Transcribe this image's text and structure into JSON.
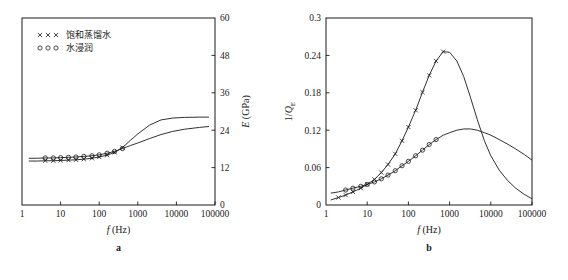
{
  "figure": {
    "panels": [
      "a",
      "b"
    ],
    "legend": {
      "entries": [
        {
          "marker": "cross-marker",
          "symbol": "× × ×",
          "label": "饱和蒸馏水"
        },
        {
          "marker": "circle-marker",
          "symbol": "○ ○ ○",
          "label": "水浸润"
        }
      ]
    }
  },
  "chart_data": [
    {
      "type": "line",
      "panel_label": "a",
      "title": "",
      "xlabel": "f (Hz)",
      "ylabel": "E (GPa)",
      "xscale": "log",
      "xlim": [
        1,
        100000
      ],
      "ylim": [
        0,
        60
      ],
      "xticks": [
        1,
        10,
        100,
        1000,
        10000,
        100000
      ],
      "xtick_labels": [
        "1",
        "10",
        "100",
        "1000",
        "10000",
        "100000"
      ],
      "yticks": [
        0,
        12,
        24,
        36,
        48,
        60
      ],
      "ytick_labels": [
        "0",
        "12",
        "24",
        "36",
        "48",
        "60"
      ],
      "yaxis_position": "right",
      "grid": false,
      "legend_position": "upper-left",
      "series": [
        {
          "name": "饱和蒸馏水",
          "marker": "cross-marker",
          "x": [
            1.5,
            2.5,
            4,
            6.5,
            10,
            16,
            25,
            40,
            65,
            100,
            160,
            250,
            400,
            650,
            1000,
            2000,
            4000,
            8000,
            16000,
            40000,
            70000
          ],
          "y": [
            14.1,
            14.1,
            14.2,
            14.2,
            14.3,
            14.4,
            14.5,
            14.7,
            15.0,
            15.4,
            16.0,
            16.9,
            18.4,
            20.8,
            22.8,
            25.6,
            27.3,
            27.9,
            28.1,
            28.2,
            28.2
          ],
          "marker_x": [
            4,
            6.5,
            10,
            16,
            25,
            40,
            65,
            100,
            160,
            250,
            400
          ],
          "marker_y": [
            14.2,
            14.2,
            14.3,
            14.4,
            14.5,
            14.7,
            15.0,
            15.4,
            16.0,
            16.9,
            18.4
          ]
        },
        {
          "name": "水浸润",
          "marker": "circle-marker",
          "x": [
            1.5,
            2.5,
            4,
            6.5,
            10,
            16,
            25,
            40,
            65,
            100,
            160,
            250,
            400,
            650,
            1000,
            2000,
            4000,
            8000,
            16000,
            40000,
            70000
          ],
          "y": [
            15.0,
            15.0,
            15.1,
            15.1,
            15.2,
            15.3,
            15.4,
            15.6,
            15.8,
            16.1,
            16.6,
            17.2,
            18.1,
            19.1,
            19.9,
            21.3,
            22.6,
            23.6,
            24.3,
            24.9,
            25.2
          ],
          "marker_x": [
            4,
            6.5,
            10,
            16,
            25,
            40,
            65,
            100,
            160,
            250,
            400
          ],
          "marker_y": [
            15.1,
            15.1,
            15.2,
            15.3,
            15.4,
            15.6,
            15.8,
            16.1,
            16.6,
            17.2,
            18.1
          ]
        }
      ]
    },
    {
      "type": "line",
      "panel_label": "b",
      "title": "",
      "xlabel": "f (Hz)",
      "ylabel": "1/Q",
      "ylabel_subscript": "E",
      "xscale": "log",
      "xlim": [
        1,
        100000
      ],
      "ylim": [
        0,
        0.3
      ],
      "xticks": [
        1,
        10,
        100,
        1000,
        10000,
        100000
      ],
      "xtick_labels": [
        "1",
        "10",
        "100",
        "1000",
        "10000",
        "100000"
      ],
      "yticks": [
        0,
        0.06,
        0.12,
        0.18,
        0.24,
        0.3
      ],
      "ytick_labels": [
        "0",
        "0.06",
        "0.12",
        "0.18",
        "0.24",
        "0.3"
      ],
      "yaxis_position": "left",
      "grid": false,
      "legend_position": "none",
      "series": [
        {
          "name": "饱和蒸馏水",
          "marker": "cross-marker",
          "peak_x": 700,
          "peak_y": 0.246,
          "x": [
            1.3,
            2,
            3,
            4.5,
            7,
            10,
            15,
            22,
            32,
            48,
            70,
            100,
            150,
            220,
            320,
            470,
            700,
            1000,
            1500,
            2200,
            3200,
            4700,
            7000,
            10000,
            16000,
            25000,
            40000,
            65000,
            100000
          ],
          "y": [
            0.008,
            0.012,
            0.016,
            0.021,
            0.027,
            0.033,
            0.041,
            0.052,
            0.065,
            0.082,
            0.103,
            0.125,
            0.152,
            0.181,
            0.208,
            0.231,
            0.246,
            0.245,
            0.231,
            0.206,
            0.173,
            0.137,
            0.103,
            0.079,
            0.056,
            0.04,
            0.027,
            0.017,
            0.01
          ],
          "marker_x": [
            2,
            3,
            4.5,
            7,
            10,
            15,
            22,
            32,
            48,
            70,
            100,
            150,
            220,
            320,
            470,
            700
          ],
          "marker_y": [
            0.012,
            0.016,
            0.021,
            0.027,
            0.033,
            0.041,
            0.052,
            0.065,
            0.082,
            0.103,
            0.125,
            0.152,
            0.181,
            0.208,
            0.231,
            0.246
          ]
        },
        {
          "name": "水浸润",
          "marker": "circle-marker",
          "peak_x": 3000,
          "peak_y": 0.122,
          "x": [
            1.3,
            2,
            3,
            4.5,
            7,
            10,
            15,
            22,
            32,
            48,
            70,
            100,
            150,
            220,
            320,
            470,
            700,
            1000,
            1500,
            2200,
            3200,
            4700,
            7000,
            10000,
            16000,
            25000,
            40000,
            65000,
            100000
          ],
          "y": [
            0.019,
            0.021,
            0.024,
            0.027,
            0.03,
            0.033,
            0.037,
            0.042,
            0.048,
            0.055,
            0.063,
            0.07,
            0.079,
            0.088,
            0.097,
            0.105,
            0.112,
            0.116,
            0.12,
            0.122,
            0.122,
            0.12,
            0.116,
            0.112,
            0.105,
            0.098,
            0.09,
            0.081,
            0.072
          ],
          "marker_x": [
            3,
            4.5,
            7,
            10,
            15,
            22,
            32,
            48,
            70,
            100,
            150,
            220,
            320,
            470
          ],
          "marker_y": [
            0.024,
            0.027,
            0.03,
            0.033,
            0.037,
            0.042,
            0.048,
            0.055,
            0.063,
            0.07,
            0.079,
            0.088,
            0.097,
            0.105
          ]
        }
      ]
    }
  ]
}
